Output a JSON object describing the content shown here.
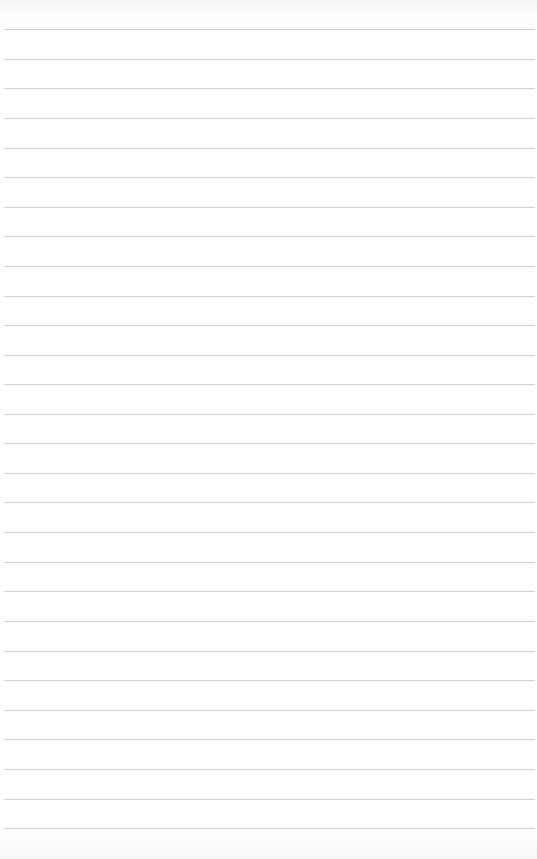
{
  "paper": {
    "type": "lined notebook paper",
    "background_color": "#ffffff",
    "line_color": "#c9c9c9",
    "line_positions_y": [
      29,
      59,
      88,
      118,
      148,
      177,
      207,
      236,
      266,
      296,
      325,
      355,
      384,
      414,
      443,
      473,
      502,
      532,
      562,
      591,
      621,
      651,
      680,
      710,
      739,
      769,
      799,
      828
    ]
  }
}
